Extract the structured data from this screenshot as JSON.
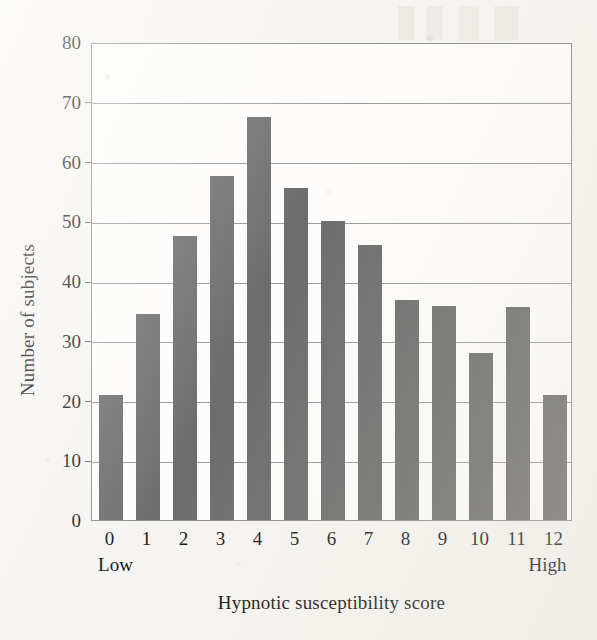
{
  "chart_data": {
    "type": "bar",
    "title": "",
    "xlabel": "Hypnotic susceptibility score",
    "ylabel": "Number of subjects",
    "categories": [
      "0",
      "1",
      "2",
      "3",
      "4",
      "5",
      "6",
      "7",
      "8",
      "9",
      "10",
      "11",
      "12"
    ],
    "values": [
      21,
      34.5,
      47.5,
      57.5,
      67.5,
      55.5,
      50,
      46,
      36.8,
      35.8,
      28,
      35.6,
      21
    ],
    "xlim": [
      -0.5,
      12.5
    ],
    "ylim": [
      0,
      80
    ],
    "ytick_labels": [
      "0",
      "10",
      "20",
      "30",
      "40",
      "50",
      "60",
      "70",
      "80"
    ],
    "ytick_values": [
      0,
      10,
      20,
      30,
      40,
      50,
      60,
      70,
      80
    ],
    "grid": "horizontal",
    "legend": "none",
    "x_axis_end_labels": {
      "left": "Low",
      "right": "High"
    },
    "bar_color": "#6d6d6d",
    "gridline_color": "#9a9a9a",
    "frame_color": "#8e8e8e",
    "background_color": "#f6f4f0",
    "plot_background_color": "#fdfcfa",
    "text_color": "#161616"
  }
}
